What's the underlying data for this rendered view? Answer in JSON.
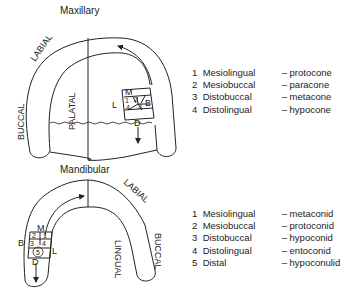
{
  "maxillary": {
    "title": "Maxillary",
    "labels": {
      "labial": "LABIAL",
      "buccal": "BUCCAL",
      "palatal": "PALATAL"
    },
    "orientation": {
      "mesial": "M",
      "lingual": "L",
      "buccal": "B",
      "distal": "D"
    },
    "cusp_numbers": [
      "1",
      "2",
      "3",
      "4"
    ],
    "legend": [
      {
        "num": "1",
        "term": "Mesiolingual",
        "cusp": "– protocone"
      },
      {
        "num": "2",
        "term": "Mesiobuccal",
        "cusp": "– paracone"
      },
      {
        "num": "3",
        "term": "Distobuccal",
        "cusp": "– metacone"
      },
      {
        "num": "4",
        "term": "Distolingual",
        "cusp": "– hypocone"
      }
    ]
  },
  "mandibular": {
    "title": "Mandibular",
    "labels": {
      "labial": "LABIAL",
      "buccal": "BUCCAL",
      "lingual": "LINGUAL"
    },
    "orientation": {
      "mesial": "M",
      "lingual": "L",
      "buccal": "B",
      "distal": "D"
    },
    "cusp_numbers": [
      "1",
      "2",
      "3",
      "4",
      "5"
    ],
    "legend": [
      {
        "num": "1",
        "term": "Mesiolingual",
        "cusp": "– metaconid"
      },
      {
        "num": "2",
        "term": "Mesiobuccal",
        "cusp": "– protoconid"
      },
      {
        "num": "3",
        "term": "Distobuccal",
        "cusp": "– hypoconid"
      },
      {
        "num": "4",
        "term": "Distolingual",
        "cusp": "– entoconid"
      },
      {
        "num": "5",
        "term": "Distal",
        "cusp": "– hypoconulid"
      }
    ]
  }
}
